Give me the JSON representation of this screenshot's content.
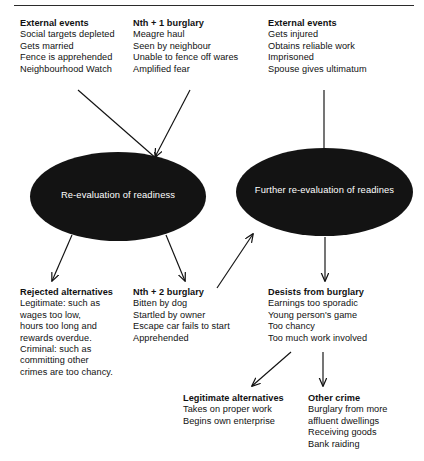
{
  "diagram": {
    "ellipse_fill": "#131313",
    "ellipse_text_color": "#ffffff",
    "line_color": "#111111",
    "background": "#ffffff"
  },
  "nodes": {
    "external_events_1": {
      "title": "External events",
      "lines": [
        "Social targets depleted",
        "Gets married",
        "Fence is apprehended",
        "Neighbourhood Watch"
      ]
    },
    "nth_plus_1_burglary": {
      "title": "Nth + 1 burglary",
      "lines": [
        "Meagre haul",
        "Seen by neighbour",
        "Unable to fence off wares",
        "Amplified fear"
      ]
    },
    "external_events_2": {
      "title": "External events",
      "lines": [
        "Gets injured",
        "Obtains reliable work",
        "Imprisoned",
        "Spouse gives ultimatum"
      ]
    },
    "re_evaluation": {
      "label": "Re-evaluation of readiness"
    },
    "further_re_evaluation": {
      "label": "Further re-evaluation of readines"
    },
    "rejected_alternatives": {
      "title": "Rejected alternatives",
      "lines": [
        "Legitimate: such as",
        "wages too low,",
        "hours too long and",
        "rewards overdue.",
        "Criminal: such as",
        "committing other",
        "crimes are too chancy."
      ]
    },
    "nth_plus_2_burglary": {
      "title": "Nth + 2 burglary",
      "lines": [
        "Bitten by dog",
        "Startled by owner",
        "Escape car fails to start",
        "Apprehended"
      ]
    },
    "desists_from_burglary": {
      "title": "Desists from burglary",
      "lines": [
        "Earnings too sporadic",
        "Young person's game",
        "Too chancy",
        "Too much work involved"
      ]
    },
    "legitimate_alternatives": {
      "title": "Legitimate alternatives",
      "lines": [
        "Takes on proper work",
        "Begins own enterprise"
      ]
    },
    "other_crime": {
      "title": "Other crime",
      "lines": [
        "Burglary from more",
        "affluent dwellings",
        "Receiving goods",
        "Bank raiding"
      ]
    }
  },
  "edges": [
    {
      "name": "external-events-1-to-re-evaluation",
      "from": "external_events_1",
      "to": "re_evaluation"
    },
    {
      "name": "nth-plus-1-to-re-evaluation",
      "from": "nth_plus_1_burglary",
      "to": "re_evaluation"
    },
    {
      "name": "external-events-2-to-further-re-evaluation",
      "from": "external_events_2",
      "to": "further_re_evaluation"
    },
    {
      "name": "re-evaluation-to-rejected-alternatives",
      "from": "re_evaluation",
      "to": "rejected_alternatives"
    },
    {
      "name": "re-evaluation-to-nth-plus-2",
      "from": "re_evaluation",
      "to": "nth_plus_2_burglary"
    },
    {
      "name": "nth-plus-2-to-further-re-evaluation",
      "from": "nth_plus_2_burglary",
      "to": "further_re_evaluation"
    },
    {
      "name": "further-re-evaluation-to-desists",
      "from": "further_re_evaluation",
      "to": "desists_from_burglary"
    },
    {
      "name": "desists-to-legitimate-alternatives",
      "from": "desists_from_burglary",
      "to": "legitimate_alternatives"
    },
    {
      "name": "desists-to-other-crime",
      "from": "desists_from_burglary",
      "to": "other_crime"
    }
  ]
}
